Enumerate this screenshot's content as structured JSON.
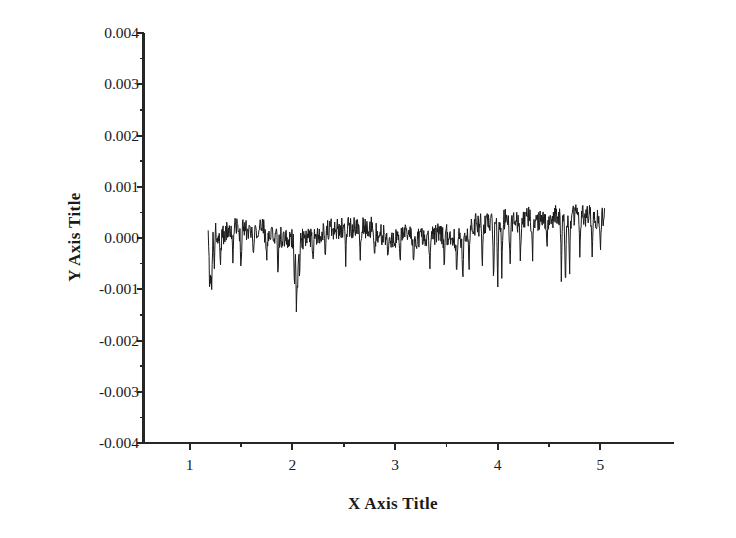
{
  "chart_data": {
    "type": "line",
    "title": "",
    "xlabel": "X Axis Title",
    "ylabel": "Y Axis Title",
    "xlim": [
      0.55,
      5.6
    ],
    "ylim": [
      -0.004,
      0.004
    ],
    "xticks": [
      1,
      2,
      3,
      4,
      5
    ],
    "xtick_labels": [
      "1",
      "2",
      "3",
      "4",
      "5"
    ],
    "xminor_ticks": [
      1.5,
      2.5,
      3.5,
      4.5
    ],
    "yticks": [
      0.004,
      0.003,
      0.002,
      0.001,
      0.0,
      -0.001,
      -0.002,
      -0.003,
      -0.004
    ],
    "ytick_labels": [
      "0.004",
      "0.003",
      "0.002",
      "0.001",
      "0.000",
      "-0.001",
      "-0.002",
      "-0.003",
      "-0.004"
    ],
    "yminor_ticks": [
      0.0035,
      0.0025,
      0.0015,
      0.0005,
      -0.0005,
      -0.0015,
      -0.0025,
      -0.0035
    ],
    "grid": false,
    "legend": null,
    "series": [
      {
        "name": "residual",
        "color": "#1a1a1a",
        "line_width": 1,
        "x_start": 1.18,
        "x_end": 5.04,
        "n_points": 900,
        "baseline": 0.00022,
        "noise_amplitude": 0.00028,
        "y_min": -0.00172,
        "y_max": 0.00082,
        "spikes": [
          {
            "x": 1.195,
            "depth": -0.00125
          },
          {
            "x": 1.205,
            "depth": -0.00095
          },
          {
            "x": 1.215,
            "depth": -0.00112
          },
          {
            "x": 1.24,
            "depth": -0.00062
          },
          {
            "x": 1.3,
            "depth": -0.00048
          },
          {
            "x": 1.42,
            "depth": -0.00055
          },
          {
            "x": 1.5,
            "depth": -0.0007
          },
          {
            "x": 1.62,
            "depth": -0.00042
          },
          {
            "x": 1.75,
            "depth": -0.00048
          },
          {
            "x": 1.86,
            "depth": -0.00075
          },
          {
            "x": 2.02,
            "depth": -0.0011
          },
          {
            "x": 2.04,
            "depth": -0.00172
          },
          {
            "x": 2.05,
            "depth": -0.00118
          },
          {
            "x": 2.07,
            "depth": -0.0009
          },
          {
            "x": 2.2,
            "depth": -0.0005
          },
          {
            "x": 2.32,
            "depth": -0.00044
          },
          {
            "x": 2.52,
            "depth": -0.00058
          },
          {
            "x": 2.66,
            "depth": -0.00052
          },
          {
            "x": 2.8,
            "depth": -0.0004
          },
          {
            "x": 2.93,
            "depth": -0.00046
          },
          {
            "x": 3.05,
            "depth": -0.00058
          },
          {
            "x": 3.18,
            "depth": -0.0005
          },
          {
            "x": 3.34,
            "depth": -0.00062
          },
          {
            "x": 3.48,
            "depth": -0.0007
          },
          {
            "x": 3.6,
            "depth": -0.00085
          },
          {
            "x": 3.66,
            "depth": -0.001
          },
          {
            "x": 3.72,
            "depth": -0.00078
          },
          {
            "x": 3.85,
            "depth": -0.0006
          },
          {
            "x": 3.96,
            "depth": -0.00095
          },
          {
            "x": 4.0,
            "depth": -0.00112
          },
          {
            "x": 4.04,
            "depth": -0.00082
          },
          {
            "x": 4.12,
            "depth": -0.00068
          },
          {
            "x": 4.22,
            "depth": -0.00052
          },
          {
            "x": 4.34,
            "depth": -0.0004
          },
          {
            "x": 4.48,
            "depth": -0.00034
          },
          {
            "x": 4.62,
            "depth": -0.00098
          },
          {
            "x": 4.66,
            "depth": -0.0012
          },
          {
            "x": 4.7,
            "depth": -0.00086
          },
          {
            "x": 4.8,
            "depth": -0.00042
          },
          {
            "x": 4.92,
            "depth": -0.00038
          },
          {
            "x": 5.0,
            "depth": -0.00036
          }
        ]
      }
    ]
  },
  "axes": {
    "x_title": "X Axis Title",
    "y_title": "Y Axis Title"
  }
}
